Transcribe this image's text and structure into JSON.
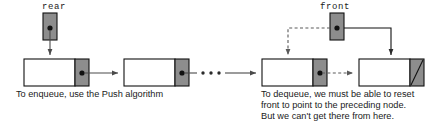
{
  "diagram": {
    "colors": {
      "node_fill": "#ffffff",
      "link_cell_fill": "#8d8d8d",
      "pointer_box_fill": "#8d8d8d",
      "stroke": "#111111",
      "arrow": "#4a4a4a",
      "text": "#1a1a1a"
    },
    "pointers": [
      {
        "id": "rear",
        "label": "rear",
        "label_x": 42,
        "label_y": 9,
        "box": {
          "x": 43,
          "y": 13,
          "w": 14,
          "h": 27
        },
        "dot": {
          "cx": 50,
          "cy": 28,
          "r": 2.6
        },
        "target_node": 0
      },
      {
        "id": "front",
        "label": "front",
        "label_x": 320,
        "label_y": 9,
        "box": {
          "x": 330,
          "y": 13,
          "w": 14,
          "h": 27
        },
        "dot": {
          "cx": 337,
          "cy": 28,
          "r": 2.6
        },
        "target_node": 2
      }
    ],
    "nodes": [
      {
        "id": "node-1",
        "x": 24,
        "y": 59,
        "w": 65,
        "h": 27,
        "data_w": 51,
        "link_type": "pointer"
      },
      {
        "id": "node-2",
        "x": 124,
        "y": 59,
        "w": 65,
        "h": 27,
        "data_w": 51,
        "link_type": "pointer"
      },
      {
        "id": "node-3",
        "x": 262,
        "y": 59,
        "w": 65,
        "h": 27,
        "data_w": 51,
        "link_type": "pointer"
      },
      {
        "id": "node-4",
        "x": 359,
        "y": 59,
        "w": 65,
        "h": 27,
        "data_w": 51,
        "link_type": "null"
      }
    ],
    "ellipsis": {
      "count": 3,
      "dots": [
        {
          "cx": 203,
          "cy": 73
        },
        {
          "cx": 211,
          "cy": 73
        },
        {
          "cx": 219,
          "cy": 73
        }
      ]
    },
    "captions": [
      {
        "id": "enqueue-caption",
        "x": 16,
        "lines": [
          {
            "text": "To enqueue, use the Push algorithm",
            "y": 97
          }
        ]
      },
      {
        "id": "dequeue-caption",
        "x": 261,
        "lines": [
          {
            "text": "To dequeue, we must be able to reset",
            "y": 97
          },
          {
            "text": "front to point to the preceding node.",
            "y": 108
          },
          {
            "text": "But we can't get there from here.",
            "y": 119
          }
        ]
      }
    ],
    "connectors": [
      {
        "id": "rear-to-node1",
        "style": "solid",
        "desc": "rear box down-arrow into first node"
      },
      {
        "id": "node1-to-node2",
        "style": "solid",
        "desc": "first node link cell to second node"
      },
      {
        "id": "node2-to-ellipsis",
        "style": "solid",
        "desc": "second node link cell toward ellipsis"
      },
      {
        "id": "ellipsis-to-node3",
        "style": "solid",
        "desc": "ellipsis to third node"
      },
      {
        "id": "front-to-node3",
        "style": "dashed",
        "desc": "front box dashed left then down into third node"
      },
      {
        "id": "front-to-node4",
        "style": "solid",
        "desc": "front box right then down into fourth node"
      },
      {
        "id": "node3-to-node4",
        "style": "dashed",
        "desc": "third node link cell dashed to fourth node"
      }
    ]
  }
}
